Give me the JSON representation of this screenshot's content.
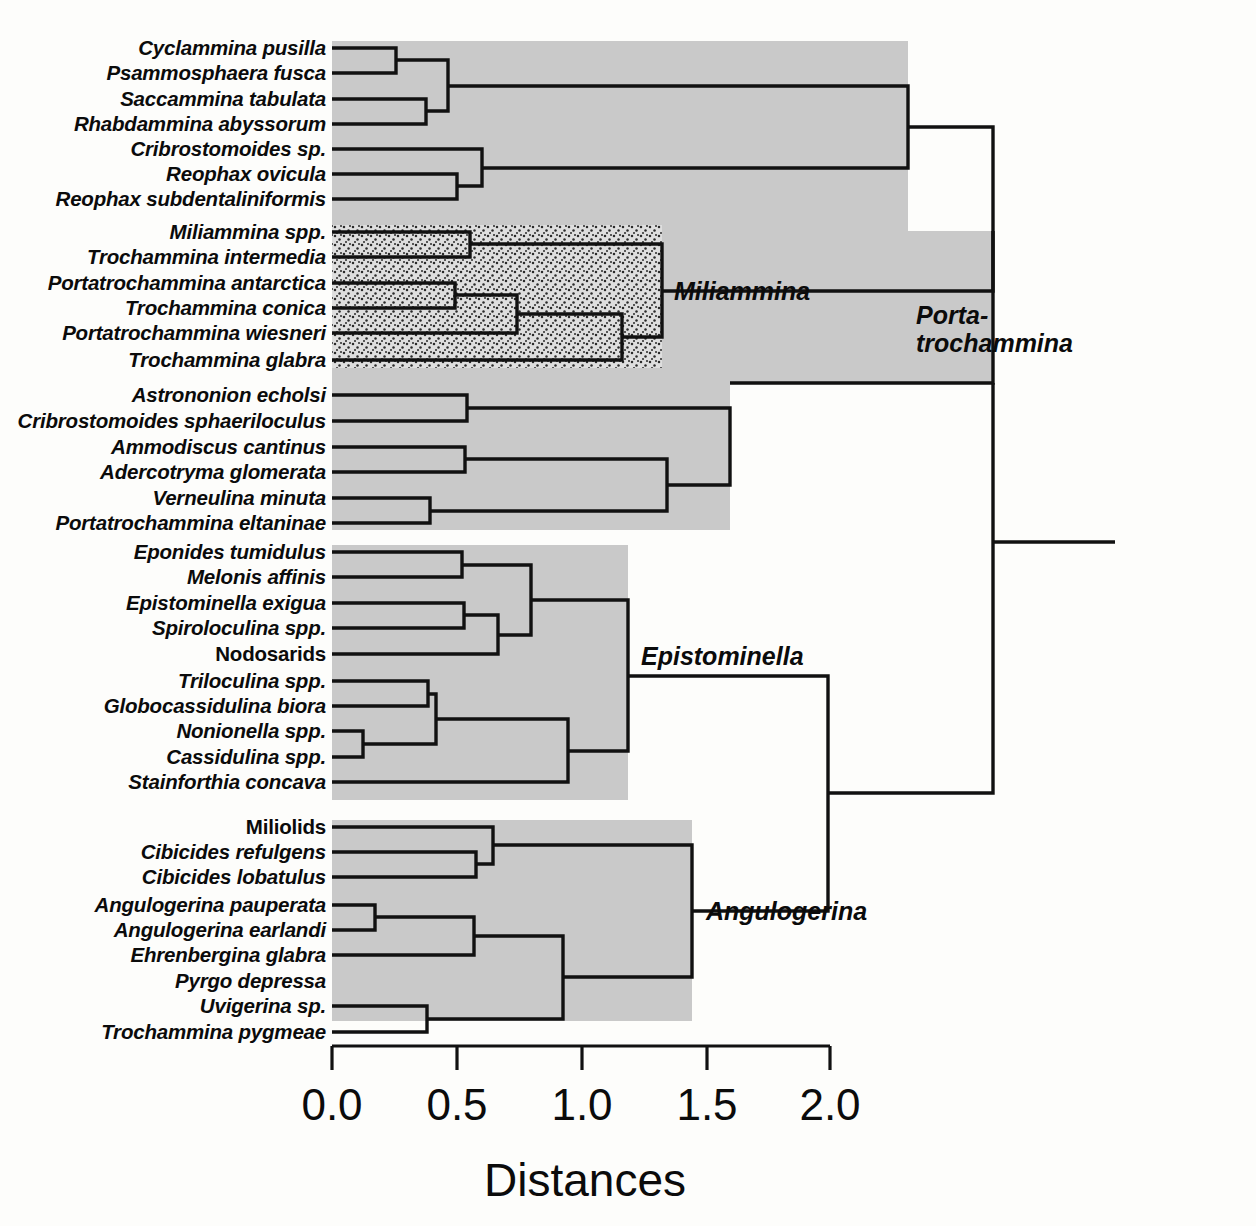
{
  "figure": {
    "kind": "dendrogram",
    "background": "#fdfdfb",
    "line_color": "#111111",
    "clade_fill_plain": "#c9c9c9",
    "clade_fill_stipple": "#d8d8d8"
  },
  "chart_data": {
    "type": "dendrogram",
    "title": "",
    "xlabel": "Distances",
    "ylabel": "",
    "xlim": [
      0.0,
      2.0
    ],
    "xticks": [
      0.0,
      0.5,
      1.0,
      1.5,
      2.0
    ],
    "xtick_labels": [
      "0.0",
      "0.5",
      "1.0",
      "1.5",
      "2.0"
    ],
    "grid": false,
    "legend": "none",
    "n_leaves": 40,
    "leaves": [
      {
        "index": 0,
        "label": "Cyclammina pusilla",
        "italic": true
      },
      {
        "index": 1,
        "label": "Psammosphaera fusca",
        "italic": true
      },
      {
        "index": 2,
        "label": "Saccammina tabulata",
        "italic": true
      },
      {
        "index": 3,
        "label": "Rhabdammina abyssorum",
        "italic": true
      },
      {
        "index": 4,
        "label": "Cribrostomoides sp.",
        "italic": true
      },
      {
        "index": 5,
        "label": "Reophax ovicula",
        "italic": true
      },
      {
        "index": 6,
        "label": "Reophax subdentaliniformis",
        "italic": true
      },
      {
        "index": 7,
        "label": "Miliammina spp.",
        "italic": true
      },
      {
        "index": 8,
        "label": "Trochammina intermedia",
        "italic": true
      },
      {
        "index": 9,
        "label": "Portatrochammina antarctica",
        "italic": true
      },
      {
        "index": 10,
        "label": "Trochammina conica",
        "italic": true
      },
      {
        "index": 11,
        "label": "Portatrochammina wiesneri",
        "italic": true
      },
      {
        "index": 12,
        "label": "Trochammina glabra",
        "italic": true
      },
      {
        "index": 13,
        "label": "Astrononion echolsi",
        "italic": true
      },
      {
        "index": 14,
        "label": "Cribrostomoides sphaeriloculus",
        "italic": true
      },
      {
        "index": 15,
        "label": "Ammodiscus cantinus",
        "italic": true
      },
      {
        "index": 16,
        "label": "Adercotryma glomerata",
        "italic": true
      },
      {
        "index": 17,
        "label": "Verneulina minuta",
        "italic": true
      },
      {
        "index": 18,
        "label": "Portatrochammina eltaninae",
        "italic": true
      },
      {
        "index": 19,
        "label": "Eponides tumidulus",
        "italic": true
      },
      {
        "index": 20,
        "label": "Melonis affinis",
        "italic": true
      },
      {
        "index": 21,
        "label": "Epistominella exigua",
        "italic": true
      },
      {
        "index": 22,
        "label": "Spiroloculina spp.",
        "italic": true
      },
      {
        "index": 23,
        "label": "Nodosarids",
        "italic": false
      },
      {
        "index": 24,
        "label": "Triloculina spp.",
        "italic": true
      },
      {
        "index": 25,
        "label": "Globocassidulina biora",
        "italic": true
      },
      {
        "index": 26,
        "label": "Nonionella spp.",
        "italic": true
      },
      {
        "index": 27,
        "label": "Cassidulina spp.",
        "italic": true
      },
      {
        "index": 28,
        "label": "Stainforthia concava",
        "italic": true
      },
      {
        "index": 29,
        "label": "Miliolids",
        "italic": false
      },
      {
        "index": 30,
        "label": "Cibicides refulgens",
        "italic": true
      },
      {
        "index": 31,
        "label": "Cibicides lobatulus",
        "italic": true
      },
      {
        "index": 32,
        "label": "Angulogerina pauperata",
        "italic": true
      },
      {
        "index": 33,
        "label": "Angulogerina earlandi",
        "italic": true
      },
      {
        "index": 34,
        "label": "Ehrenbergina glabra",
        "italic": true
      },
      {
        "index": 35,
        "label": "Pyrgo depressa",
        "italic": true
      },
      {
        "index": 36,
        "label": "Uvigerina sp.",
        "italic": true
      },
      {
        "index": 37,
        "label": "Trochammina pygmeae",
        "italic": true
      }
    ],
    "clade_labels": [
      {
        "name": "Miliammina",
        "text": "Miliammina",
        "lines": [
          "Miliammina"
        ]
      },
      {
        "name": "Portatrochammina",
        "text": "Porta-trochammina",
        "lines": [
          "Porta-",
          "trochammina"
        ]
      },
      {
        "name": "Epistominella",
        "text": "Epistominella",
        "lines": [
          "Epistominella"
        ]
      },
      {
        "name": "Angulogerina",
        "text": "Angulogerina",
        "lines": [
          "Angulogerina"
        ]
      }
    ],
    "merges": [
      {
        "id": "m0",
        "height": 0.26,
        "members": [
          "Cyclammina pusilla",
          "Psammosphaera fusca"
        ]
      },
      {
        "id": "m1",
        "height": 0.38,
        "members": [
          "Saccammina tabulata",
          "Rhabdammina abyssorum"
        ]
      },
      {
        "id": "m2",
        "height": 0.47,
        "members": [
          "m0",
          "m1"
        ]
      },
      {
        "id": "m3",
        "height": 0.5,
        "members": [
          "Reophax ovicula",
          "Reophax subdentaliniformis"
        ]
      },
      {
        "id": "m4",
        "height": 0.6,
        "members": [
          "Cribrostomoides sp.",
          "m3"
        ]
      },
      {
        "id": "m5",
        "height": 0.9,
        "members": [
          "m2",
          "m4"
        ]
      },
      {
        "id": "m6",
        "height": 0.33,
        "members": [
          "Miliammina spp.",
          "Trochammina intermedia"
        ]
      },
      {
        "id": "m7",
        "height": 0.3,
        "members": [
          "Portatrochammina antarctica",
          "Trochammina conica"
        ]
      },
      {
        "id": "m8",
        "height": 0.38,
        "members": [
          "m7",
          "Portatrochammina wiesneri"
        ]
      },
      {
        "id": "m9",
        "height": 0.58,
        "members": [
          "m8",
          "Trochammina glabra"
        ]
      },
      {
        "id": "m10",
        "height": 0.73,
        "members": [
          "m6",
          "m9"
        ]
      },
      {
        "id": "m11",
        "height": 1.15,
        "members": [
          "m5",
          "m10"
        ]
      },
      {
        "id": "m12",
        "height": 0.32,
        "members": [
          "Astrononion echolsi",
          "Cribrostomoides sphaeriloculus"
        ]
      },
      {
        "id": "m13",
        "height": 0.53,
        "members": [
          "Ammodiscus cantinus",
          "Adercotryma glomerata"
        ]
      },
      {
        "id": "m14",
        "height": 0.34,
        "members": [
          "Verneulina minuta",
          "Portatrochammina eltaninae"
        ]
      },
      {
        "id": "m15",
        "height": 0.8,
        "members": [
          "m13",
          "m14"
        ]
      },
      {
        "id": "m16",
        "height": 1.0,
        "members": [
          "m12",
          "m15"
        ]
      },
      {
        "id": "m17",
        "height": 1.28,
        "members": [
          "m11",
          "m16"
        ]
      },
      {
        "id": "m18",
        "height": 0.29,
        "members": [
          "Eponides tumidulus",
          "Melonis affinis"
        ]
      },
      {
        "id": "m19",
        "height": 0.3,
        "members": [
          "Epistominella exigua",
          "Spiroloculina spp."
        ]
      },
      {
        "id": "m20",
        "height": 0.4,
        "members": [
          "m19",
          "Nodosarids"
        ]
      },
      {
        "id": "m21",
        "height": 0.53,
        "members": [
          "m18",
          "m20"
        ]
      },
      {
        "id": "m22",
        "height": 0.22,
        "members": [
          "Triloculina spp.",
          "Globocassidulina biora"
        ]
      },
      {
        "id": "m23",
        "height": 0.06,
        "members": [
          "Nonionella spp.",
          "Cassidulina spp."
        ]
      },
      {
        "id": "m24",
        "height": 0.25,
        "members": [
          "m22",
          "m23"
        ]
      },
      {
        "id": "m25",
        "height": 0.6,
        "members": [
          "m24",
          "Stainforthia concava"
        ]
      },
      {
        "id": "m26",
        "height": 0.73,
        "members": [
          "m21",
          "m25"
        ]
      },
      {
        "id": "m27",
        "height": 0.4,
        "members": [
          "Cibicides refulgens",
          "Cibicides lobatulus"
        ]
      },
      {
        "id": "m28",
        "height": 0.43,
        "members": [
          "Miliolids",
          "m27"
        ]
      },
      {
        "id": "m29",
        "height": 0.07,
        "members": [
          "Angulogerina pauperata",
          "Angulogerina earlandi"
        ]
      },
      {
        "id": "m30",
        "height": 0.33,
        "members": [
          "m29",
          "Ehrenbergina glabra"
        ]
      },
      {
        "id": "m31",
        "height": 0.58,
        "members": [
          "Uvigerina sp.",
          "Trochammina pygmeae"
        ]
      },
      {
        "id": "m32",
        "height": 0.72,
        "members": [
          "m30",
          "m31"
        ]
      },
      {
        "id": "m33",
        "height": 0.9,
        "members": [
          "m28",
          "m32"
        ]
      },
      {
        "id": "m34",
        "height": 1.27,
        "members": [
          "m26",
          "m33"
        ]
      },
      {
        "id": "m35",
        "height": 1.68,
        "members": [
          "m17",
          "m34"
        ]
      }
    ]
  },
  "axis": {
    "title": "Distances",
    "ticks": [
      "0.0",
      "0.5",
      "1.0",
      "1.5",
      "2.0"
    ]
  },
  "clades": {
    "miliammina": "Miliammina",
    "porta_line1": "Porta-",
    "porta_line2": "trochammina",
    "epistominella": "Epistominella",
    "angulogerina": "Angulogerina"
  }
}
